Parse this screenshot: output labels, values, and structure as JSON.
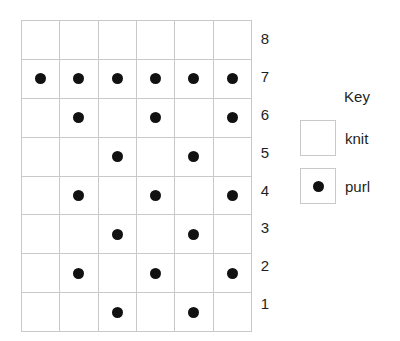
{
  "chart_data": {
    "type": "heatmap",
    "title": "",
    "xlabel": "",
    "ylabel": "",
    "columns": 6,
    "rows": 8,
    "row_labels": [
      "8",
      "7",
      "6",
      "5",
      "4",
      "3",
      "2",
      "1"
    ],
    "row_label_position": "right",
    "grid": true,
    "legend_position": "right",
    "cell_symbols": {
      "knit": "",
      "purl": "●"
    },
    "values_top_to_bottom": [
      [
        "knit",
        "knit",
        "knit",
        "knit",
        "knit",
        "knit"
      ],
      [
        "purl",
        "purl",
        "purl",
        "purl",
        "purl",
        "purl"
      ],
      [
        "knit",
        "purl",
        "knit",
        "purl",
        "knit",
        "purl"
      ],
      [
        "knit",
        "knit",
        "purl",
        "knit",
        "purl",
        "knit"
      ],
      [
        "knit",
        "purl",
        "knit",
        "purl",
        "knit",
        "purl"
      ],
      [
        "knit",
        "knit",
        "purl",
        "knit",
        "purl",
        "knit"
      ],
      [
        "knit",
        "purl",
        "knit",
        "purl",
        "knit",
        "purl"
      ],
      [
        "knit",
        "knit",
        "purl",
        "knit",
        "purl",
        "knit"
      ]
    ],
    "rows_data": [
      {
        "label": "8",
        "cells": [
          "knit",
          "knit",
          "knit",
          "knit",
          "knit",
          "knit"
        ]
      },
      {
        "label": "7",
        "cells": [
          "purl",
          "purl",
          "purl",
          "purl",
          "purl",
          "purl"
        ]
      },
      {
        "label": "6",
        "cells": [
          "knit",
          "purl",
          "knit",
          "purl",
          "knit",
          "purl"
        ]
      },
      {
        "label": "5",
        "cells": [
          "knit",
          "knit",
          "purl",
          "knit",
          "purl",
          "knit"
        ]
      },
      {
        "label": "4",
        "cells": [
          "knit",
          "purl",
          "knit",
          "purl",
          "knit",
          "purl"
        ]
      },
      {
        "label": "3",
        "cells": [
          "knit",
          "knit",
          "purl",
          "knit",
          "purl",
          "knit"
        ]
      },
      {
        "label": "2",
        "cells": [
          "knit",
          "purl",
          "knit",
          "purl",
          "knit",
          "purl"
        ]
      },
      {
        "label": "1",
        "cells": [
          "knit",
          "knit",
          "purl",
          "knit",
          "purl",
          "knit"
        ]
      }
    ],
    "legend": [
      {
        "symbol": "knit",
        "label": "knit"
      },
      {
        "symbol": "purl",
        "label": "purl"
      }
    ]
  },
  "key": {
    "title": "Key",
    "items": [
      {
        "symbol": "knit",
        "label": "knit"
      },
      {
        "symbol": "purl",
        "label": "purl"
      }
    ]
  },
  "colors": {
    "dot": "#111111",
    "grid_line": "#c9c9c9",
    "text": "#231f20",
    "background": "#ffffff"
  }
}
